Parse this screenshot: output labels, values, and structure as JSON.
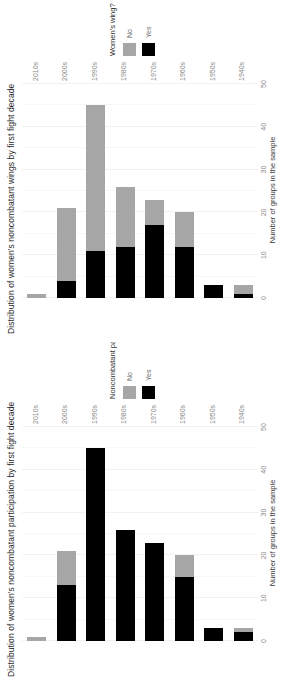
{
  "figure": {
    "background": "#ffffff",
    "bar_color_yes": "#000000",
    "bar_color_no": "#a6a6a6",
    "grid_color": "#f2f2f2"
  },
  "panels": [
    {
      "key": "participation",
      "title": "Distribution of women's noncombatant participation by first fight decade",
      "y_axis_label": "Number of groups in the sample",
      "legend_title": "Noncombatant participation",
      "legend": [
        {
          "label": "No",
          "color": "#a6a6a6"
        },
        {
          "label": "Yes",
          "color": "#000000"
        }
      ]
    },
    {
      "key": "wings",
      "title": "Distribution of women's noncombatant wings by first fight decade",
      "y_axis_label": "Number of groups in the sample",
      "legend_title": "Women's wing?",
      "legend": [
        {
          "label": "No",
          "color": "#a6a6a6"
        },
        {
          "label": "Yes",
          "color": "#000000"
        }
      ]
    }
  ],
  "axis_ticks": [
    "0",
    "10",
    "20",
    "30",
    "40",
    "50"
  ],
  "categories": [
    "1940s",
    "1950s",
    "1960s",
    "1970s",
    "1980s",
    "1990s",
    "2000s",
    "2010s"
  ],
  "chart_data": [
    {
      "type": "bar",
      "orientation": "horizontal",
      "stacked": true,
      "title": "Distribution of women's noncombatant participation by first fight decade",
      "xlabel": "",
      "ylabel": "Number of groups in the sample",
      "ylim": [
        0,
        50
      ],
      "grid": true,
      "legend_title": "Noncombatant participation",
      "legend_position": "right",
      "categories": [
        "1940s",
        "1950s",
        "1960s",
        "1970s",
        "1980s",
        "1990s",
        "2000s",
        "2010s"
      ],
      "series": [
        {
          "name": "Yes",
          "color": "#000000",
          "values": [
            2,
            3,
            15,
            23,
            26,
            45,
            13,
            0
          ]
        },
        {
          "name": "No",
          "color": "#a6a6a6",
          "values": [
            1,
            0,
            5,
            0,
            0,
            0,
            8,
            1
          ]
        }
      ],
      "totals": [
        3,
        3,
        20,
        23,
        26,
        45,
        21,
        1
      ]
    },
    {
      "type": "bar",
      "orientation": "horizontal",
      "stacked": true,
      "title": "Distribution of women's noncombatant wings by first fight decade",
      "xlabel": "",
      "ylabel": "Number of groups in the sample",
      "ylim": [
        0,
        50
      ],
      "grid": true,
      "legend_title": "Women's wing?",
      "legend_position": "right",
      "categories": [
        "1940s",
        "1950s",
        "1960s",
        "1970s",
        "1980s",
        "1990s",
        "2000s",
        "2010s"
      ],
      "series": [
        {
          "name": "Yes",
          "color": "#000000",
          "values": [
            1,
            3,
            12,
            17,
            12,
            11,
            4,
            0
          ]
        },
        {
          "name": "No",
          "color": "#a6a6a6",
          "values": [
            2,
            0,
            8,
            6,
            14,
            34,
            17,
            1
          ]
        }
      ],
      "totals": [
        3,
        3,
        20,
        23,
        26,
        45,
        21,
        1
      ]
    }
  ]
}
